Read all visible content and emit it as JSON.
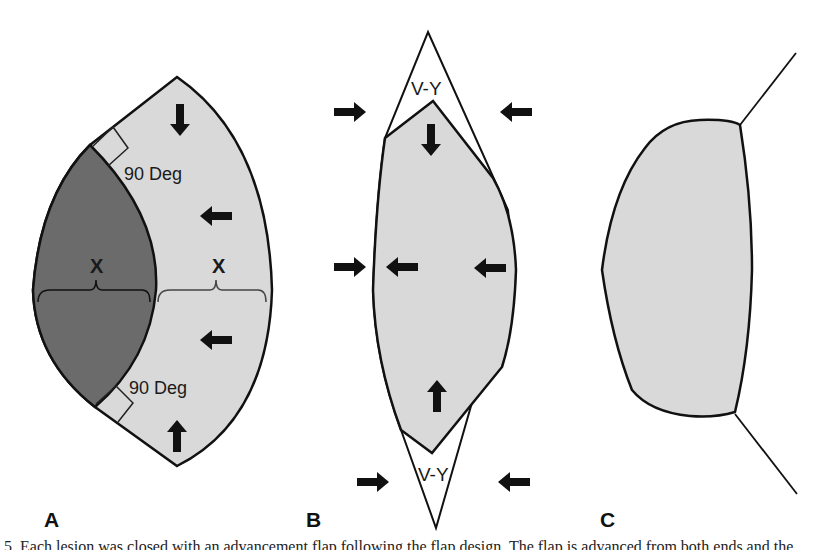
{
  "figure": {
    "panels": [
      {
        "id": "A",
        "label": "A",
        "angle_labels": [
          "90 Deg",
          "90 Deg"
        ],
        "width_labels": [
          "X",
          "X"
        ],
        "arrows": [
          "down",
          "left",
          "left",
          "up"
        ],
        "colors": {
          "dark_region": "#6b6b6b",
          "light_region": "#d9d9d9"
        }
      },
      {
        "id": "B",
        "label": "B",
        "vy_labels": [
          "V-Y",
          "V-Y"
        ],
        "outer_arrows": [
          "right",
          "left",
          "right",
          "right",
          "left"
        ],
        "inner_arrows": [
          "down",
          "left",
          "left",
          "up"
        ],
        "colors": {
          "flap": "#d9d9d9"
        }
      },
      {
        "id": "C",
        "label": "C",
        "colors": {
          "flap": "#d9d9d9"
        }
      }
    ],
    "caption": "5. Each lesion was closed with an advancement flap following the flap design. The flap is advanced from both ends and the"
  }
}
